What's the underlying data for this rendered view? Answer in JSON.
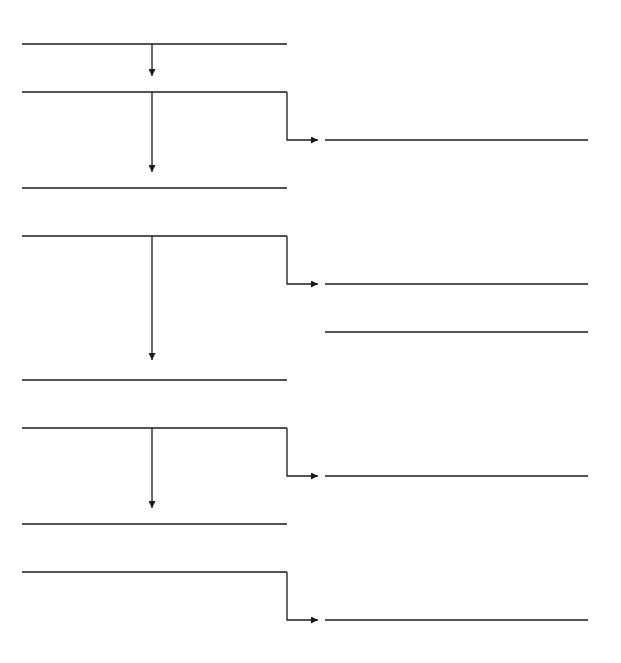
{
  "diagram": {
    "stroke_color": "#1a1a1a",
    "background": "#ffffff",
    "left_lines": [
      {
        "y": 44
      },
      {
        "y": 92
      },
      {
        "y": 188
      },
      {
        "y": 236
      },
      {
        "y": 380
      },
      {
        "y": 428
      },
      {
        "y": 524
      },
      {
        "y": 572
      }
    ],
    "left_x": [
      22,
      287
    ],
    "right_lines": [
      {
        "y": 140
      },
      {
        "y": 284
      },
      {
        "y": 332
      },
      {
        "y": 476
      },
      {
        "y": 620
      }
    ],
    "right_x": [
      325,
      588
    ],
    "down_arrows": [
      {
        "x": 152,
        "y1": 44,
        "y2": 76
      },
      {
        "x": 152,
        "y1": 92,
        "y2": 172
      },
      {
        "x": 152,
        "y1": 236,
        "y2": 360
      },
      {
        "x": 152,
        "y1": 428,
        "y2": 508
      }
    ],
    "elbow_arrows": [
      {
        "x": 287,
        "y1": 92,
        "y2": 140,
        "x2": 318
      },
      {
        "x": 287,
        "y1": 236,
        "y2": 284,
        "x2": 318
      },
      {
        "x": 287,
        "y1": 428,
        "y2": 476,
        "x2": 318
      },
      {
        "x": 287,
        "y1": 572,
        "y2": 620,
        "x2": 318
      }
    ]
  }
}
